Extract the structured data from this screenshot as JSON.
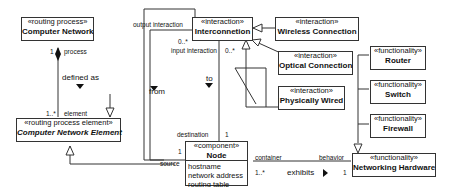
{
  "classes": {
    "computer_network": {
      "stereotype": "«routing process»",
      "name": "Computer Network"
    },
    "computer_network_element": {
      "stereotype": "«routing process element»",
      "name": "Computer Network Element"
    },
    "interconnection": {
      "stereotype": "«interaction»",
      "name": "Interconnetion"
    },
    "wireless_connection": {
      "stereotype": "«interaction»",
      "name": "Wireless Connection"
    },
    "optical_connection": {
      "stereotype": "«interaction»",
      "name": "Optical Connection"
    },
    "physically_wired": {
      "stereotype": "«interaction»",
      "name": "Physically Wired"
    },
    "node": {
      "stereotype": "«component»",
      "name": "Node",
      "attributes": [
        "hostname",
        "network address",
        "routing table"
      ]
    },
    "router": {
      "stereotype": "«functionality»",
      "name": "Router"
    },
    "switch": {
      "stereotype": "«functionality»",
      "name": "Switch"
    },
    "firewall": {
      "stereotype": "«functionality»",
      "name": "Firewall"
    },
    "networking_hardware": {
      "stereotype": "«functionality»",
      "name": "Networking Hardware"
    }
  },
  "labels": {
    "process_mult": "1",
    "process_role": "process",
    "defined_as": "defined as",
    "element_mult": "1..*",
    "element_role": "element",
    "output_interaction": "output interaction",
    "output_mult": "0..*",
    "input_interaction": "input interaction",
    "input_mult": "0..*",
    "from": "from",
    "to": "to",
    "destination": "destination",
    "destination_mult": "1",
    "source_mult": "1",
    "source": "source",
    "container": "container",
    "container_mult": "1..*",
    "exhibits": "exhibits",
    "behavior": "behavior",
    "behavior_mult": "1"
  }
}
